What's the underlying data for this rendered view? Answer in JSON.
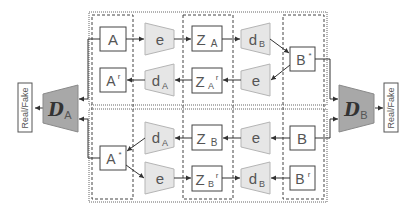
{
  "diagram": {
    "title": "",
    "colors": {
      "box_border": "#444444",
      "box_fill": "#ffffff",
      "module_fill": "#e6e6e6",
      "module_border": "#b5b5b5",
      "discriminator_fill": "#a8a8a8",
      "discriminator_border": "#8a8a8a",
      "line": "#333333"
    },
    "top_row": {
      "input": "A",
      "encoder": "e",
      "latent": "Z",
      "latent_sub": "A",
      "decoder": "d",
      "decoder_sub": "B",
      "generated": "B",
      "generated_sup": "*"
    },
    "top_recon_row": {
      "recon": "A",
      "recon_sup": "r",
      "decoder": "d",
      "decoder_sub": "A",
      "latent": "Z",
      "latent_sub": "A",
      "latent_sup": "r",
      "encoder": "e"
    },
    "bottom_row": {
      "generated": "A",
      "generated_sup": "*",
      "decoder": "d",
      "decoder_sub": "A",
      "latent": "Z",
      "latent_sub": "B",
      "encoder": "e",
      "input": "B"
    },
    "bottom_recon_row": {
      "encoder": "e",
      "latent": "Z",
      "latent_sub": "B",
      "latent_sup": "r",
      "decoder": "d",
      "decoder_sub": "B",
      "recon": "B",
      "recon_sup": "r"
    },
    "discriminators": [
      {
        "name": "D",
        "sub": "A",
        "output": "Real/Fake"
      },
      {
        "name": "D",
        "sub": "B",
        "output": "Real/Fake"
      }
    ]
  }
}
